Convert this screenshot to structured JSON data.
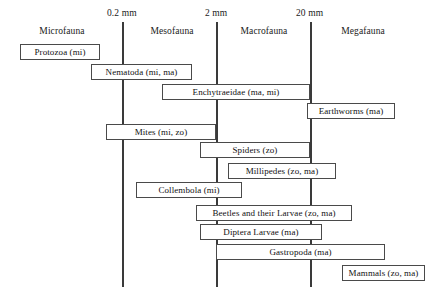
{
  "diagram": {
    "scale_marks": [
      {
        "label": "0.2 mm",
        "x": 122
      },
      {
        "label": "2 mm",
        "x": 216
      },
      {
        "label": "20 mm",
        "x": 310
      }
    ],
    "zones": [
      {
        "label": "Microfauna",
        "center": 62
      },
      {
        "label": "Mesofauna",
        "center": 172
      },
      {
        "label": "Macrofauna",
        "center": 263
      },
      {
        "label": "Megafauna",
        "center": 363
      }
    ],
    "taxa": [
      {
        "label": "Protozoa (mi)",
        "x": 20,
        "y": 44,
        "w": 80
      },
      {
        "label": "Nematoda (mi, ma)",
        "x": 91,
        "y": 64,
        "w": 101
      },
      {
        "label": "Enchytraeidae (ma, mi)",
        "x": 162,
        "y": 84,
        "w": 148
      },
      {
        "label": "Earthworms (ma)",
        "x": 307,
        "y": 103,
        "w": 88
      },
      {
        "label": "Mites (mi, zo)",
        "x": 106,
        "y": 124,
        "w": 110
      },
      {
        "label": "Spiders (zo)",
        "x": 200,
        "y": 142,
        "w": 110
      },
      {
        "label": "Millipedes (zo, ma)",
        "x": 228,
        "y": 163,
        "w": 108
      },
      {
        "label": "Collembola (mi)",
        "x": 136,
        "y": 182,
        "w": 106
      },
      {
        "label": "Beetles and their Larvae (zo, ma)",
        "x": 196,
        "y": 205,
        "w": 156
      },
      {
        "label": "Diptera Larvae (ma)",
        "x": 200,
        "y": 224,
        "w": 122
      },
      {
        "label": "Gastropoda (ma)",
        "x": 216,
        "y": 244,
        "w": 169
      },
      {
        "label": "Mammals (zo, ma)",
        "x": 342,
        "y": 265,
        "w": 83
      }
    ]
  }
}
